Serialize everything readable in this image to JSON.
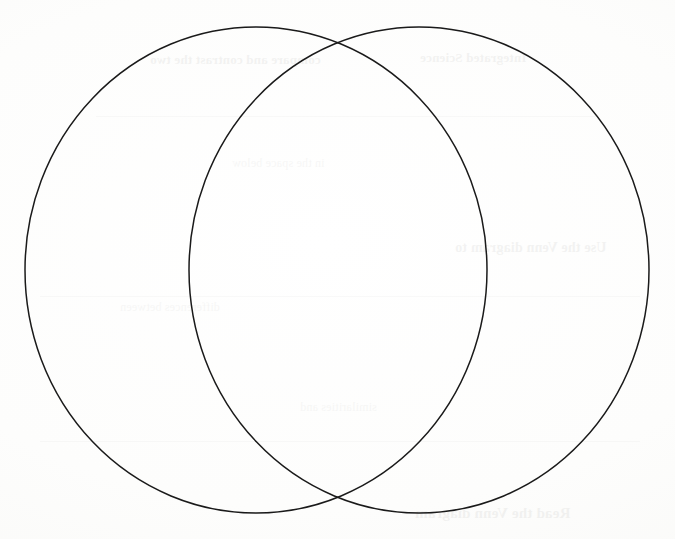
{
  "page": {
    "width": 675,
    "height": 539,
    "background_color": "#fcfcfb",
    "marker_label": "5"
  },
  "diagram": {
    "type": "venn",
    "name": "two-circle-venn-diagram",
    "stroke_color": "#1a1a1a",
    "stroke_width": 1.5,
    "fill": "none",
    "circles": [
      {
        "id": "left-circle",
        "label": "",
        "cx": 256,
        "cy": 270,
        "rx": 231,
        "ry": 243
      },
      {
        "id": "right-circle",
        "label": "",
        "cx": 419,
        "cy": 270,
        "rx": 230,
        "ry": 243
      }
    ],
    "intersections": [
      {
        "id": "top-intersection",
        "x": 340,
        "y": 45
      },
      {
        "id": "bottom-intersection",
        "x": 340,
        "y": 494
      }
    ],
    "regions": [
      {
        "id": "left-only-region",
        "label": ""
      },
      {
        "id": "overlap-region",
        "label": ""
      },
      {
        "id": "right-only-region",
        "label": ""
      }
    ]
  },
  "showthrough": {
    "note": "faint mirrored text bleeding through from the reverse side of the sheet",
    "lines": [
      {
        "id": "g1",
        "text": "compare and contrast the two"
      },
      {
        "id": "g2",
        "text": "Integrated Science"
      },
      {
        "id": "g3",
        "text": "in the space below"
      },
      {
        "id": "g4",
        "text": "Use the Venn diagram to"
      },
      {
        "id": "g5",
        "text": "Read the Venn diagram"
      },
      {
        "id": "g6",
        "text": "differences between"
      },
      {
        "id": "g7",
        "text": "similarities and"
      }
    ]
  }
}
